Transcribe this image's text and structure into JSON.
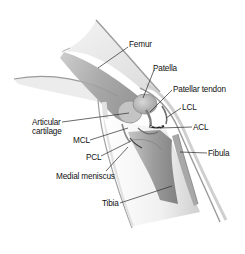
{
  "diagram": {
    "type": "anatomical-illustration",
    "colors": {
      "background": "#ffffff",
      "skin_outline": "#9a9a9a",
      "bone_shade": "#8d8d8d",
      "label_text": "#111111",
      "leader_line": "#2a2a2a"
    },
    "labels": [
      {
        "id": "femur",
        "text": "Femur"
      },
      {
        "id": "patella",
        "text": "Patella"
      },
      {
        "id": "patellar_tendon",
        "text": "Patellar tendon"
      },
      {
        "id": "lcl",
        "text": "LCL"
      },
      {
        "id": "acl",
        "text": "ACL"
      },
      {
        "id": "articular_cartilage_1",
        "text": "Articular"
      },
      {
        "id": "articular_cartilage_2",
        "text": "cartilage"
      },
      {
        "id": "mcl",
        "text": "MCL"
      },
      {
        "id": "pcl",
        "text": "PCL"
      },
      {
        "id": "medial_meniscus",
        "text": "Medial meniscus"
      },
      {
        "id": "fibula",
        "text": "Fibula"
      },
      {
        "id": "tibia",
        "text": "Tibia"
      }
    ]
  }
}
